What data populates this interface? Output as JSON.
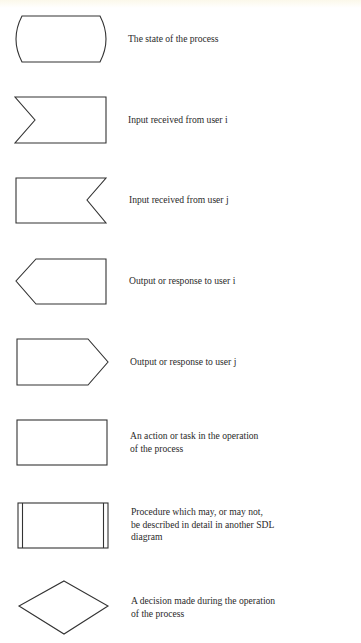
{
  "legend": {
    "title_visible": false,
    "items": [
      {
        "symbol": "state",
        "label": "The state of the process"
      },
      {
        "symbol": "input-from-user-i",
        "label": "Input received from user i"
      },
      {
        "symbol": "input-from-user-j",
        "label": "Input received from user j"
      },
      {
        "symbol": "output-to-user-i",
        "label": "Output or response to user i"
      },
      {
        "symbol": "output-to-user-j",
        "label": "Output or response to user j"
      },
      {
        "symbol": "task",
        "label": "An action or task in the operation\nof the process"
      },
      {
        "symbol": "procedure",
        "label": "Procedure which may, or may not,\nbe described in detail in another SDL\ndiagram"
      },
      {
        "symbol": "decision",
        "label": "A decision made during the operation\nof the process"
      }
    ]
  },
  "colors": {
    "stroke": "#333333",
    "text": "#2a2a2a",
    "background": "#ffffff"
  }
}
